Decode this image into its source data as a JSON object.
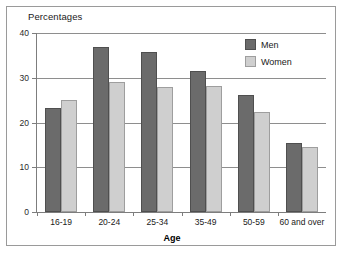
{
  "figure": {
    "background_color": "#ffffff",
    "frame_color": "#9a9a9a",
    "axis_color": "#7d7d7d",
    "grid_color": "#8e8e8e"
  },
  "chart_data": {
    "type": "bar",
    "title": "Percentages",
    "xlabel": "Age",
    "ylabel": "",
    "categories": [
      "16-19",
      "20-24",
      "25-34",
      "35-49",
      "50-59",
      "60 and over"
    ],
    "series": [
      {
        "name": "Men",
        "color": "#6b6b6b",
        "values": [
          23.2,
          36.9,
          35.7,
          31.6,
          26.2,
          15.5
        ]
      },
      {
        "name": "Women",
        "color": "#cfcfcf",
        "values": [
          25.1,
          29.1,
          28.0,
          28.1,
          22.3,
          14.6
        ]
      }
    ],
    "ylim": [
      0,
      40
    ],
    "yticks": [
      0,
      10,
      20,
      30,
      40
    ],
    "ytick_labels": [
      "0",
      "10",
      "20",
      "30",
      "40"
    ],
    "grid": true,
    "grid_axis": "y",
    "legend_position": "upper right",
    "legend_entries": [
      "Men",
      "Women"
    ]
  }
}
